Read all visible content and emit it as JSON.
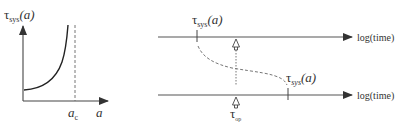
{
  "left_panel": {
    "y_label": "τ",
    "y_label_sub": "sys",
    "y_label_arg": "(a)",
    "x_label": "a",
    "critical_label": "a",
    "critical_label_sub": "c"
  },
  "right_panel": {
    "top_axis_label": "log(time)",
    "bottom_axis_label": "log(time)",
    "top_tau_label": "τ",
    "top_tau_sub": "sys",
    "top_tau_arg": "(a)",
    "bottom_tau_label": "τ",
    "bottom_tau_sub": "sys",
    "bottom_tau_arg": "(a)",
    "op_label": "τ",
    "op_label_sub": "op"
  },
  "colors": {
    "line": "#444444",
    "text": "#333333"
  }
}
